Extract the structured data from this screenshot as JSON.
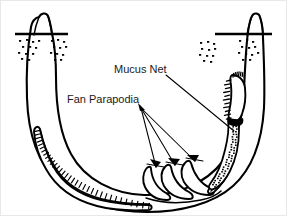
{
  "figure": {
    "kind": "biological-diagram",
    "background_color": "#ffffff",
    "ink_color": "#000000",
    "text_color": "#1a1a1a"
  },
  "labels": [
    {
      "id": "mucus-net",
      "text": "Mucus Net",
      "x": 113,
      "y": 72,
      "leader": {
        "from_x": 165,
        "from_y": 74,
        "to_x": 233,
        "to_y": 130
      }
    },
    {
      "id": "fan-parapodia",
      "text": "Fan Parapodia",
      "x": 66,
      "y": 102,
      "leader_origin": {
        "x": 140,
        "y": 107
      },
      "arrow_targets": [
        {
          "x": 155,
          "y": 166
        },
        {
          "x": 174,
          "y": 164
        },
        {
          "x": 194,
          "y": 160
        }
      ]
    }
  ],
  "structures": {
    "left_chimney": {
      "name": "left-tube-opening",
      "substrate_line_y": 33,
      "substrate_line_x1": 14,
      "substrate_line_x2": 67
    },
    "right_chimney": {
      "name": "right-tube-opening",
      "substrate_line_y": 33,
      "substrate_line_x1": 214,
      "substrate_line_x2": 271
    },
    "sediment_dots_left": [
      [
        18,
        39
      ],
      [
        25,
        38
      ],
      [
        31,
        40
      ],
      [
        37,
        39
      ],
      [
        21,
        45
      ],
      [
        28,
        45
      ],
      [
        34,
        46
      ],
      [
        17,
        51
      ],
      [
        24,
        52
      ],
      [
        31,
        52
      ],
      [
        20,
        57
      ],
      [
        27,
        58
      ],
      [
        50,
        39
      ],
      [
        56,
        38
      ],
      [
        62,
        40
      ],
      [
        52,
        45
      ],
      [
        58,
        46
      ],
      [
        64,
        45
      ],
      [
        49,
        51
      ],
      [
        55,
        52
      ],
      [
        61,
        53
      ],
      [
        53,
        58
      ],
      [
        59,
        58
      ]
    ],
    "sediment_dots_right": [
      [
        199,
        41
      ],
      [
        206,
        40
      ],
      [
        212,
        42
      ],
      [
        200,
        47
      ],
      [
        207,
        48
      ],
      [
        213,
        47
      ],
      [
        198,
        53
      ],
      [
        205,
        54
      ],
      [
        211,
        54
      ],
      [
        202,
        59
      ],
      [
        209,
        60
      ],
      [
        238,
        39
      ],
      [
        245,
        38
      ],
      [
        251,
        40
      ],
      [
        240,
        45
      ],
      [
        247,
        46
      ],
      [
        253,
        45
      ],
      [
        237,
        51
      ],
      [
        244,
        52
      ],
      [
        250,
        53
      ],
      [
        241,
        58
      ],
      [
        248,
        58
      ],
      [
        256,
        51
      ]
    ],
    "worm": {
      "name": "segmented-worm-body",
      "segment_tick_count": 34,
      "head_region": "right-arm-upper",
      "parapodia_count": 3
    },
    "mucus_net": {
      "name": "mucus-net-bag",
      "stipple_count": 52,
      "location": "right-arm-lower-interior"
    }
  }
}
